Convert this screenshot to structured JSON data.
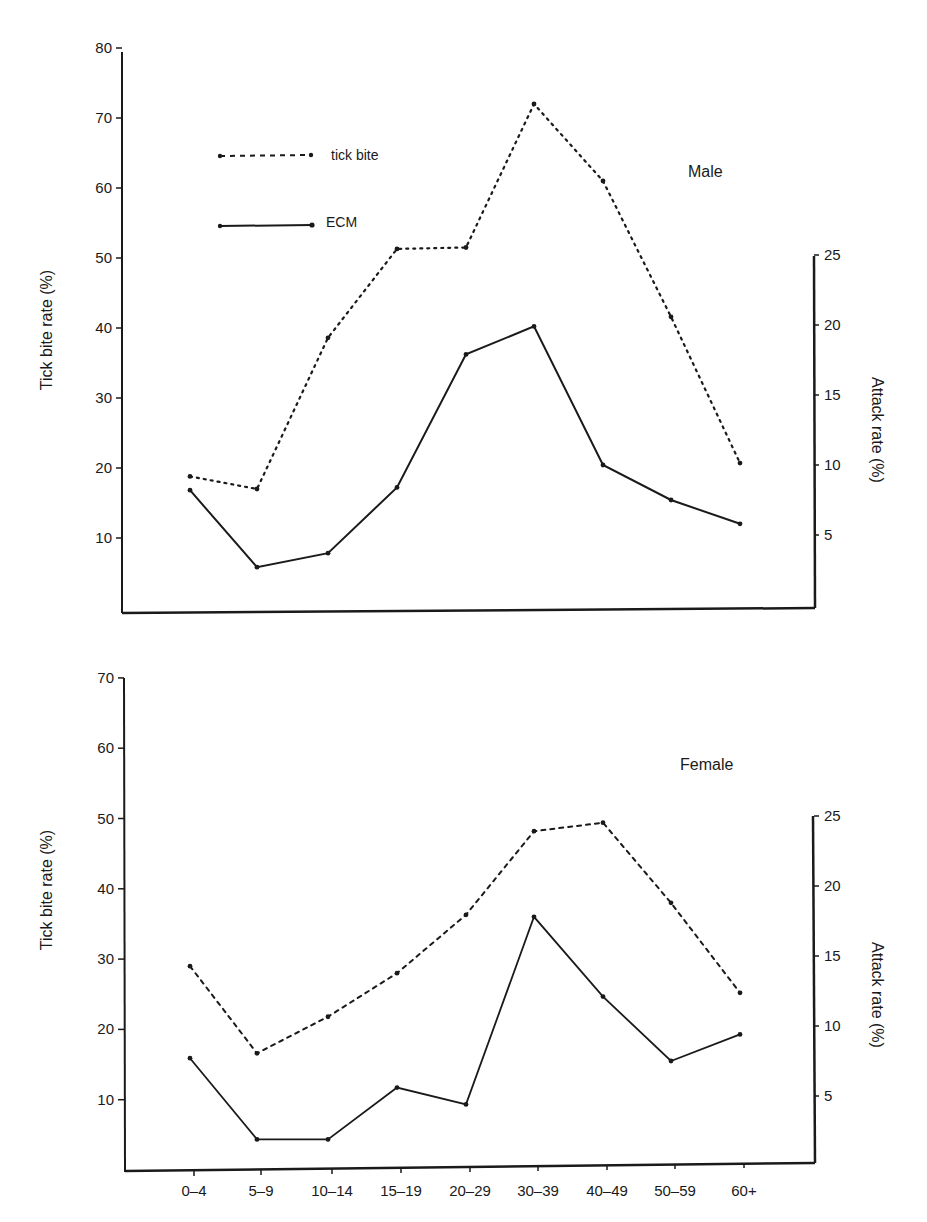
{
  "chart_data": [
    {
      "type": "line",
      "title": "Male",
      "categories": [
        "0-4",
        "5-9",
        "10-14",
        "15-19",
        "20-29",
        "30-39",
        "40-49",
        "50-59",
        "60+"
      ],
      "ylabel": "Tick bite rate (%)",
      "y2label": "Attack rate (%)",
      "ylim": [
        0,
        80
      ],
      "y2lim": [
        0,
        25
      ],
      "yticks": [
        10,
        20,
        30,
        40,
        50,
        60,
        70,
        80
      ],
      "y2ticks": [
        5,
        10,
        15,
        20,
        25
      ],
      "series": [
        {
          "name": "tick bite",
          "axis": "left",
          "style": "dotted",
          "values": [
            18.8,
            17.0,
            38.6,
            51.3,
            51.5,
            72.0,
            61.0,
            41.6,
            20.7
          ]
        },
        {
          "name": "ECM",
          "axis": "right",
          "style": "solid",
          "values": [
            8.2,
            2.7,
            3.7,
            8.4,
            17.9,
            19.9,
            10.0,
            7.5,
            5.8
          ]
        }
      ],
      "legend": [
        "tick bite",
        "ECM"
      ],
      "legend_position": "upper-left",
      "grid": false
    },
    {
      "type": "line",
      "title": "Female",
      "categories": [
        "0-4",
        "5-9",
        "10-14",
        "15-19",
        "20-29",
        "30-39",
        "40-49",
        "50-59",
        "60+"
      ],
      "xlabel": "",
      "ylabel": "Tick bite rate (%)",
      "y2label": "Attack rate (%)",
      "ylim": [
        0,
        70
      ],
      "y2lim": [
        0,
        25
      ],
      "yticks": [
        10,
        20,
        30,
        40,
        50,
        60,
        70
      ],
      "y2ticks": [
        5,
        10,
        15,
        20,
        25
      ],
      "series": [
        {
          "name": "tick bite",
          "axis": "left",
          "style": "dotted",
          "values": [
            29.0,
            16.6,
            21.8,
            28.0,
            36.3,
            48.2,
            49.4,
            38.0,
            25.2
          ]
        },
        {
          "name": "ECM",
          "axis": "right",
          "style": "solid",
          "values": [
            7.7,
            1.9,
            1.9,
            5.6,
            4.4,
            17.8,
            12.1,
            7.5,
            9.4
          ]
        }
      ],
      "grid": false
    }
  ],
  "male": {
    "panel_label": "Male",
    "y_title": "Tick bite rate (%)",
    "y2_title": "Attack rate (%)",
    "yticks": [
      "10",
      "20",
      "30",
      "40",
      "50",
      "60",
      "70",
      "80"
    ],
    "y2ticks": [
      "5",
      "10",
      "15",
      "20",
      "25"
    ],
    "legend": {
      "tick_bite": "tick bite",
      "ecm": "ECM"
    }
  },
  "female": {
    "panel_label": "Female",
    "y_title": "Tick bite rate (%)",
    "y2_title": "Attack rate (%)",
    "yticks": [
      "10",
      "20",
      "30",
      "40",
      "50",
      "60",
      "70"
    ],
    "y2ticks": [
      "5",
      "10",
      "15",
      "20",
      "25"
    ],
    "xticks": [
      "0–4",
      "5–9",
      "10–14",
      "15–19",
      "20–29",
      "30–39",
      "40–49",
      "50–59",
      "60+"
    ]
  },
  "colors": {
    "ink": "#1a1a1a",
    "background": "#ffffff"
  }
}
